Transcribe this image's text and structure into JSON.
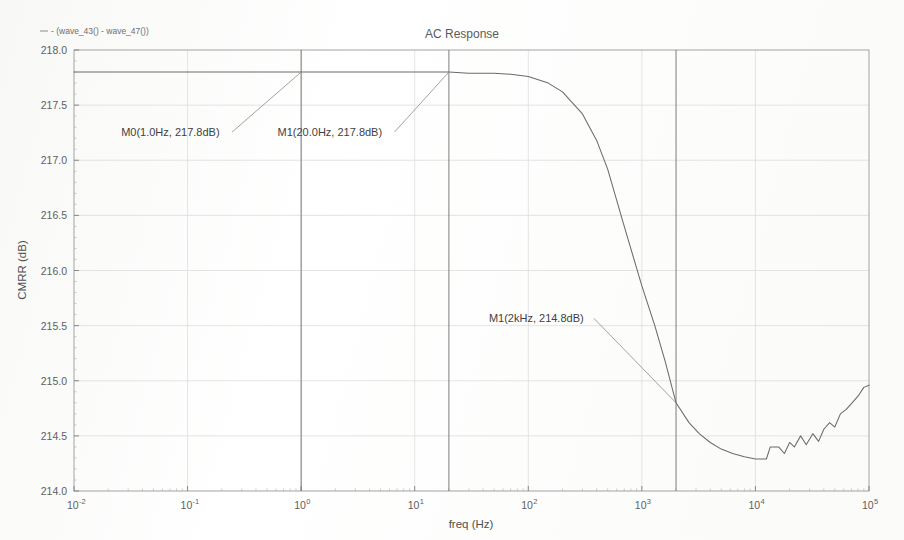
{
  "chart_data": {
    "type": "line",
    "title": "AC Response",
    "xlabel": "freq (Hz)",
    "ylabel": "CMRR (dB)",
    "xscale": "log",
    "xlim": [
      0.01,
      100000
    ],
    "ylim": [
      214.0,
      218.0
    ],
    "grid": true,
    "legend_position": "top-left",
    "legend": [
      "- (wave_43() - wave_47())"
    ],
    "xtick_labels": [
      "10-2",
      "10-1",
      "100",
      "101",
      "102",
      "103",
      "104",
      "105"
    ],
    "xtick_mantissa": [
      "10",
      "10",
      "10",
      "10",
      "10",
      "10",
      "10",
      "10"
    ],
    "xtick_exponents": [
      "-2",
      "-1",
      "0",
      "1",
      "2",
      "3",
      "4",
      "5"
    ],
    "ytick_labels": [
      "214.0",
      "214.5",
      "215.0",
      "215.5",
      "216.0",
      "216.5",
      "217.0",
      "217.5",
      "218.0"
    ],
    "ytick_values": [
      214.0,
      214.5,
      215.0,
      215.5,
      216.0,
      216.5,
      217.0,
      217.5,
      218.0
    ],
    "series": [
      {
        "name": "- (wave_43() - wave_47())",
        "color": "#6b6b6b",
        "x": [
          0.01,
          0.02,
          0.05,
          0.1,
          0.2,
          0.5,
          1.0,
          2.0,
          5.0,
          10.0,
          20.0,
          30.0,
          50.0,
          70.0,
          100.0,
          150.0,
          200.0,
          300.0,
          400.0,
          500.0,
          700.0,
          1000.0,
          1300.0,
          1600.0,
          2000.0,
          2600.0,
          3200.0,
          4000.0,
          5000.0,
          6300.0,
          8000.0,
          10000.0,
          11000.0,
          12500.0,
          13500.0,
          14500.0,
          16000.0,
          18000.0,
          20000.0,
          22000.0,
          25000.0,
          28000.0,
          32000.0,
          36000.0,
          40000.0,
          45000.0,
          50000.0,
          56000.0,
          63000.0,
          71000.0,
          80000.0,
          90000.0,
          100000.0
        ],
        "y": [
          217.8,
          217.8,
          217.8,
          217.8,
          217.8,
          217.8,
          217.8,
          217.8,
          217.8,
          217.8,
          217.8,
          217.79,
          217.79,
          217.78,
          217.76,
          217.7,
          217.62,
          217.42,
          217.18,
          216.92,
          216.4,
          215.86,
          215.5,
          215.18,
          214.8,
          214.62,
          214.52,
          214.44,
          214.38,
          214.34,
          214.31,
          214.29,
          214.29,
          214.29,
          214.4,
          214.4,
          214.4,
          214.34,
          214.44,
          214.4,
          214.5,
          214.42,
          214.52,
          214.45,
          214.56,
          214.62,
          214.58,
          214.7,
          214.74,
          214.8,
          214.86,
          214.94,
          214.96
        ]
      }
    ],
    "markers": [
      {
        "id": "M0",
        "label": "M0(1.0Hz, 217.8dB)",
        "freq_hz": 1.0,
        "value_db": 217.8,
        "label_x": 0.026,
        "label_y": 217.22
      },
      {
        "id": "M1a",
        "label": "M1(20.0Hz, 217.8dB)",
        "freq_hz": 20.0,
        "value_db": 217.8,
        "label_x": 0.62,
        "label_y": 217.22
      },
      {
        "id": "M1b",
        "label": "M1(2kHz, 214.8dB)",
        "freq_hz": 2000.0,
        "value_db": 214.8,
        "label_x": 45.0,
        "label_y": 215.53
      }
    ]
  }
}
